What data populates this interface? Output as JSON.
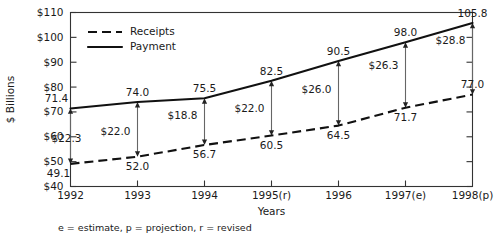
{
  "chart_data": {
    "type": "line",
    "title": "",
    "subtitle": "",
    "xlabel": "Years",
    "ylabel": "$ Billions",
    "categories": [
      "1992",
      "1993",
      "1994",
      "1995(r)",
      "1996",
      "1997(e)",
      "1998(p)"
    ],
    "ylim": [
      40,
      110
    ],
    "yticks": [
      40,
      50,
      60,
      70,
      80,
      90,
      100,
      110
    ],
    "ytick_labels": [
      "$40",
      "$50",
      "$60",
      "$70",
      "$80",
      "$90",
      "$100",
      "$110"
    ],
    "grid": false,
    "legend_position": "top-left-inside",
    "series": [
      {
        "name": "Receipts",
        "style": "dashed",
        "values": [
          49.1,
          52.0,
          56.7,
          60.5,
          64.5,
          71.7,
          77.0
        ],
        "value_labels": [
          "49.1",
          "52.0",
          "56.7",
          "60.5",
          "64.5",
          "71.7",
          "77.0"
        ]
      },
      {
        "name": "Payment",
        "style": "solid",
        "values": [
          71.4,
          74.0,
          75.5,
          82.5,
          90.5,
          98.0,
          105.8
        ],
        "value_labels": [
          "71.4",
          "74.0",
          "75.5",
          "82.5",
          "90.5",
          "98.0",
          "105.8"
        ]
      }
    ],
    "annotations": {
      "description": "double-headed vertical arrows showing the gap between Payment and Receipts at each year",
      "gap_labels": [
        "$22.3",
        "$22.0",
        "$18.8",
        "$22.0",
        "$26.0",
        "$26.3",
        "$28.8"
      ],
      "gap_values": [
        22.3,
        22.0,
        18.8,
        22.0,
        26.0,
        26.3,
        28.8
      ]
    },
    "footnote": "e = estimate, p = projection, r = revised",
    "colors": {
      "line": "#111111",
      "arrow": "#666666",
      "axis": "#333333",
      "text": "#1a1a1a",
      "background": "#ffffff"
    }
  },
  "legend": {
    "items": [
      {
        "label": "Receipts",
        "style": "dashed"
      },
      {
        "label": "Payment",
        "style": "solid"
      }
    ]
  }
}
